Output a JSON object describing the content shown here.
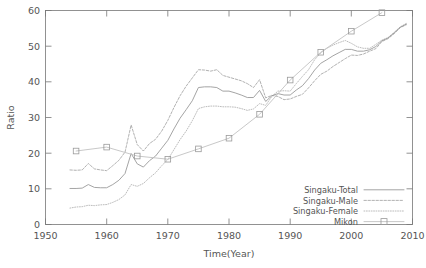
{
  "chart_data": {
    "type": "line",
    "title": "",
    "xlabel": "Time(Year)",
    "ylabel": "Ratio",
    "xlim": [
      1950,
      2010
    ],
    "ylim": [
      0,
      60
    ],
    "xticks": [
      1950,
      1960,
      1970,
      1980,
      1990,
      2000,
      2010
    ],
    "yticks": [
      0,
      10,
      20,
      30,
      40,
      50,
      60
    ],
    "grid": false,
    "legend_position": "bottom-right",
    "series": [
      {
        "name": "Singaku-Total",
        "style": "solid",
        "x": [
          1954,
          1955,
          1956,
          1957,
          1958,
          1959,
          1960,
          1961,
          1962,
          1963,
          1964,
          1965,
          1966,
          1967,
          1968,
          1969,
          1970,
          1971,
          1972,
          1973,
          1974,
          1975,
          1976,
          1977,
          1978,
          1979,
          1980,
          1981,
          1982,
          1983,
          1984,
          1985,
          1986,
          1987,
          1988,
          1989,
          1990,
          1991,
          1992,
          1993,
          1994,
          1995,
          1996,
          1997,
          1998,
          1999,
          2000,
          2001,
          2002,
          2003,
          2004,
          2005,
          2006,
          2007,
          2008,
          2009
        ],
        "y": [
          10.1,
          10.1,
          10.2,
          11.2,
          10.4,
          10.3,
          10.3,
          11.2,
          12.4,
          14.3,
          19.9,
          17.0,
          16.1,
          17.9,
          19.2,
          21.4,
          23.6,
          26.8,
          29.8,
          32.2,
          34.7,
          38.4,
          38.6,
          38.6,
          38.4,
          37.4,
          37.4,
          36.9,
          36.3,
          35.6,
          35.6,
          37.6,
          34.5,
          36.1,
          36.7,
          36.3,
          36.3,
          37.7,
          38.9,
          40.9,
          43.3,
          45.2,
          46.2,
          47.3,
          48.2,
          49.1,
          49.1,
          48.6,
          48.6,
          49.0,
          49.9,
          51.5,
          52.3,
          53.7,
          55.3,
          56.2
        ]
      },
      {
        "name": "Singaku-Male",
        "style": "dashed",
        "x": [
          1954,
          1955,
          1956,
          1957,
          1958,
          1959,
          1960,
          1961,
          1962,
          1963,
          1964,
          1965,
          1966,
          1967,
          1968,
          1969,
          1970,
          1971,
          1972,
          1973,
          1974,
          1975,
          1976,
          1977,
          1978,
          1979,
          1980,
          1981,
          1982,
          1983,
          1984,
          1985,
          1986,
          1987,
          1988,
          1989,
          1990,
          1991,
          1992,
          1993,
          1994,
          1995,
          1996,
          1997,
          1998,
          1999,
          2000,
          2001,
          2002,
          2003,
          2004,
          2005,
          2006,
          2007,
          2008,
          2009
        ],
        "y": [
          15.3,
          15.2,
          15.3,
          17.1,
          15.6,
          15.3,
          15.1,
          16.5,
          18.0,
          20.3,
          27.9,
          22.4,
          20.6,
          22.7,
          23.9,
          26.2,
          29.2,
          32.8,
          36.1,
          38.8,
          41.1,
          43.4,
          43.3,
          43.0,
          43.4,
          41.8,
          41.3,
          40.8,
          40.3,
          39.5,
          38.4,
          40.6,
          35.5,
          36.2,
          35.9,
          35.0,
          35.2,
          35.9,
          36.5,
          38.3,
          40.3,
          42.1,
          43.0,
          44.3,
          45.4,
          46.5,
          47.5,
          47.4,
          47.8,
          48.6,
          49.3,
          51.3,
          52.1,
          53.5,
          55.2,
          56.0
        ]
      },
      {
        "name": "Singaku-Female",
        "style": "dotted",
        "x": [
          1954,
          1955,
          1956,
          1957,
          1958,
          1959,
          1960,
          1961,
          1962,
          1963,
          1964,
          1965,
          1966,
          1967,
          1968,
          1969,
          1970,
          1971,
          1972,
          1973,
          1974,
          1975,
          1976,
          1977,
          1978,
          1979,
          1980,
          1981,
          1982,
          1983,
          1984,
          1985,
          1986,
          1987,
          1988,
          1989,
          1990,
          1991,
          1992,
          1993,
          1994,
          1995,
          1996,
          1997,
          1998,
          1999,
          2000,
          2001,
          2002,
          2003,
          2004,
          2005,
          2006,
          2007,
          2008,
          2009
        ],
        "y": [
          4.6,
          4.9,
          5.0,
          5.4,
          5.3,
          5.5,
          5.6,
          6.2,
          7.0,
          8.3,
          11.2,
          10.7,
          11.5,
          13.1,
          14.5,
          16.5,
          18.2,
          21.0,
          23.8,
          26.2,
          29.1,
          32.5,
          33.0,
          33.2,
          33.2,
          33.0,
          33.0,
          32.9,
          32.5,
          32.0,
          32.4,
          33.9,
          33.4,
          35.9,
          37.4,
          37.5,
          37.4,
          39.5,
          41.5,
          43.4,
          46.2,
          48.1,
          49.4,
          50.3,
          51.0,
          51.6,
          50.8,
          49.8,
          49.4,
          49.4,
          50.5,
          51.7,
          52.4,
          53.9,
          55.4,
          56.4
        ]
      },
      {
        "name": "Mikon",
        "style": "points-line",
        "marker": "open-square",
        "x": [
          1955,
          1960,
          1965,
          1970,
          1975,
          1980,
          1985,
          1990,
          1995,
          2000,
          2005
        ],
        "y": [
          20.6,
          21.7,
          19.2,
          18.3,
          21.2,
          24.2,
          30.9,
          40.5,
          48.3,
          54.2,
          59.4
        ]
      }
    ]
  },
  "legend": {
    "items": [
      {
        "label": "Singaku-Total",
        "style": "solid"
      },
      {
        "label": "Singaku-Male",
        "style": "dashed"
      },
      {
        "label": "Singaku-Female",
        "style": "dotted"
      },
      {
        "label": "Mikon",
        "style": "points-line"
      }
    ]
  },
  "axes": {
    "y_title": "Ratio",
    "x_title": "Time(Year)",
    "x_tick_labels": [
      "1950",
      "1960",
      "1970",
      "1980",
      "1990",
      "2000",
      "2010"
    ],
    "y_tick_labels": [
      "0",
      "10",
      "20",
      "30",
      "40",
      "50",
      "60"
    ]
  },
  "colors": {
    "frame": "#777777",
    "text": "#555555",
    "total": "#9a9a9a",
    "male": "#a8a8a8",
    "female": "#b4b4b4",
    "mikon": "#c2c2c2",
    "background": "#ffffff"
  }
}
